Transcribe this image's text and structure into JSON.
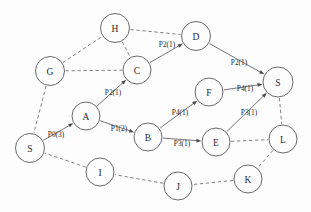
{
  "diagram": {
    "type": "node-link-graph",
    "background_color": "#fdfdfd",
    "node_stroke_color": "#59595e",
    "edge_color": "#6b6b70",
    "text_color": "#2b2b30",
    "nodes": [
      {
        "id": "S_left",
        "label": "S",
        "x": 30,
        "y": 148,
        "r": 14.5
      },
      {
        "id": "G",
        "label": "G",
        "x": 50,
        "y": 71,
        "r": 14.5
      },
      {
        "id": "H",
        "label": "H",
        "x": 115,
        "y": 28,
        "r": 14.5
      },
      {
        "id": "C",
        "label": "C",
        "x": 137,
        "y": 70,
        "r": 14.0
      },
      {
        "id": "D",
        "label": "D",
        "x": 196,
        "y": 36,
        "r": 14.5
      },
      {
        "id": "A",
        "label": "A",
        "x": 86,
        "y": 116,
        "r": 14.0
      },
      {
        "id": "B",
        "label": "B",
        "x": 148,
        "y": 137,
        "r": 14.0
      },
      {
        "id": "F",
        "label": "F",
        "x": 209,
        "y": 92,
        "r": 14.0
      },
      {
        "id": "E",
        "label": "E",
        "x": 216,
        "y": 142,
        "r": 14.0
      },
      {
        "id": "S_right",
        "label": "S",
        "x": 278,
        "y": 82,
        "r": 15.0
      },
      {
        "id": "L",
        "label": "L",
        "x": 283,
        "y": 139,
        "r": 14.0
      },
      {
        "id": "K",
        "label": "K",
        "x": 248,
        "y": 179,
        "r": 14.0
      },
      {
        "id": "J",
        "label": "J",
        "x": 178,
        "y": 186,
        "r": 14.0
      },
      {
        "id": "I",
        "label": "I",
        "x": 100,
        "y": 172,
        "r": 14.0
      }
    ],
    "edges": [
      {
        "id": "e-G-H",
        "from": "G",
        "to": "H",
        "style": "dashed",
        "arrow": false,
        "label": ""
      },
      {
        "id": "e-H-D",
        "from": "H",
        "to": "D",
        "style": "dashed",
        "arrow": false,
        "label": ""
      },
      {
        "id": "e-H-C",
        "from": "H",
        "to": "C",
        "style": "dashed",
        "arrow": false,
        "label": ""
      },
      {
        "id": "e-G-C",
        "from": "G",
        "to": "C",
        "style": "dashed",
        "arrow": false,
        "label": ""
      },
      {
        "id": "e-G-Sleft",
        "from": "G",
        "to": "S_left",
        "style": "dashed",
        "arrow": false,
        "label": ""
      },
      {
        "id": "e-C-D",
        "from": "C",
        "to": "D",
        "style": "solid",
        "arrow": true,
        "label": "P2(1)",
        "label_x": 167,
        "label_y": 44
      },
      {
        "id": "e-D-Sright",
        "from": "D",
        "to": "S_right",
        "style": "solid",
        "arrow": true,
        "label": "P2(1)",
        "label_x": 239,
        "label_y": 62
      },
      {
        "id": "e-Sleft-A",
        "from": "S_left",
        "to": "A",
        "style": "solid",
        "arrow": true,
        "label": "P0(3)",
        "label_x": 56,
        "label_y": 134
      },
      {
        "id": "e-A-C",
        "from": "A",
        "to": "C",
        "style": "solid",
        "arrow": true,
        "label": "P2(1)",
        "label_x": 113,
        "label_y": 92
      },
      {
        "id": "e-A-B",
        "from": "A",
        "to": "B",
        "style": "solid",
        "arrow": true,
        "label": "P1(2)",
        "label_x": 119,
        "label_y": 128
      },
      {
        "id": "e-B-F",
        "from": "B",
        "to": "F",
        "style": "solid",
        "arrow": true,
        "label": "P4(1)",
        "label_x": 180,
        "label_y": 112
      },
      {
        "id": "e-B-E",
        "from": "B",
        "to": "E",
        "style": "solid",
        "arrow": true,
        "label": "P3(1)",
        "label_x": 182,
        "label_y": 143
      },
      {
        "id": "e-F-Sright",
        "from": "F",
        "to": "S_right",
        "style": "solid",
        "arrow": true,
        "label": "P4(1)",
        "label_x": 245,
        "label_y": 88
      },
      {
        "id": "e-E-Sright",
        "from": "E",
        "to": "S_right",
        "style": "solid",
        "arrow": true,
        "label": "P3(1)",
        "label_x": 249,
        "label_y": 112
      },
      {
        "id": "e-Sright-L",
        "from": "S_right",
        "to": "L",
        "style": "dashed",
        "arrow": false,
        "label": ""
      },
      {
        "id": "e-E-L",
        "from": "E",
        "to": "L",
        "style": "dashed",
        "arrow": false,
        "label": ""
      },
      {
        "id": "e-L-K",
        "from": "L",
        "to": "K",
        "style": "dashed",
        "arrow": false,
        "label": ""
      },
      {
        "id": "e-K-J",
        "from": "K",
        "to": "J",
        "style": "dashed",
        "arrow": false,
        "label": ""
      },
      {
        "id": "e-J-I",
        "from": "J",
        "to": "I",
        "style": "dashed",
        "arrow": false,
        "label": ""
      },
      {
        "id": "e-I-Sleft",
        "from": "I",
        "to": "S_left",
        "style": "dashed",
        "arrow": false,
        "label": ""
      }
    ]
  }
}
